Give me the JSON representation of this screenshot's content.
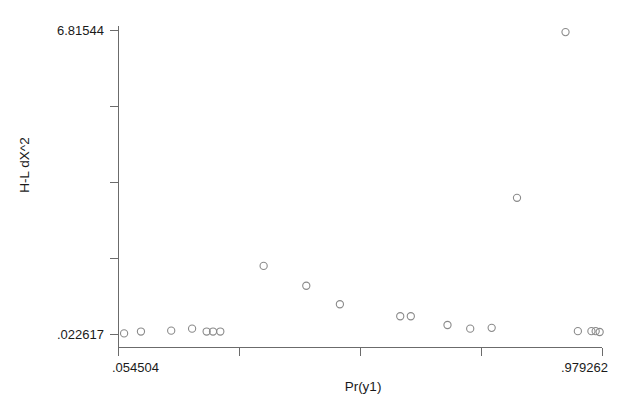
{
  "chart_data": {
    "type": "scatter",
    "title": "",
    "xlabel": "Pr(y1)",
    "ylabel": "H-L dX^2",
    "grid": false,
    "legend": null,
    "xlim": [
      0.054504,
      0.979262
    ],
    "ylim": [
      0.022617,
      6.81544
    ],
    "x_tick_labels": [
      ".054504",
      "",
      "",
      "",
      ".979262"
    ],
    "y_tick_labels": [
      "6.81544",
      "",
      "",
      "",
      ".022617"
    ],
    "x_tick_values": [
      0.054504,
      0.285694,
      0.516883,
      0.748073,
      0.979262
    ],
    "y_tick_values": [
      6.81544,
      5.117384,
      3.419327,
      1.721271,
      0.022617
    ],
    "marker": "open-circle",
    "points": [
      {
        "x": 0.0652,
        "y": 0.047
      },
      {
        "x": 0.2229,
        "y": 0.0888
      },
      {
        "x": 0.0974,
        "y": 0.0888
      },
      {
        "x": 0.1951,
        "y": 0.1532
      },
      {
        "x": 0.1552,
        "y": 0.1082
      },
      {
        "x": 0.2351,
        "y": 0.0888
      },
      {
        "x": 0.249,
        "y": 0.0888
      },
      {
        "x": 0.7675,
        "y": 0.171
      },
      {
        "x": 0.7265,
        "y": 0.1532
      },
      {
        "x": 0.6831,
        "y": 0.235
      },
      {
        "x": 0.9322,
        "y": 0.0978
      },
      {
        "x": 0.9738,
        "y": 0.079
      },
      {
        "x": 0.9581,
        "y": 0.0978
      },
      {
        "x": 0.9662,
        "y": 0.0978
      },
      {
        "x": 0.613,
        "y": 0.43
      },
      {
        "x": 0.5928,
        "y": 0.43
      },
      {
        "x": 0.4775,
        "y": 0.698
      },
      {
        "x": 0.4133,
        "y": 1.112
      },
      {
        "x": 0.3318,
        "y": 1.555
      },
      {
        "x": 0.8159,
        "y": 3.077
      },
      {
        "x": 0.9086,
        "y": 6.78
      }
    ]
  },
  "axes": {
    "x_title": "Pr(y1)",
    "y_title": "H-L dX^2",
    "x_min_label": ".054504",
    "x_max_label": ".979262",
    "y_min_label": ".022617",
    "y_max_label": "6.81544"
  },
  "colors": {
    "background": "#ffffff",
    "axis": "#6b6b6b",
    "marker_stroke": "#8a8a8a",
    "text": "#1a1a1a"
  }
}
